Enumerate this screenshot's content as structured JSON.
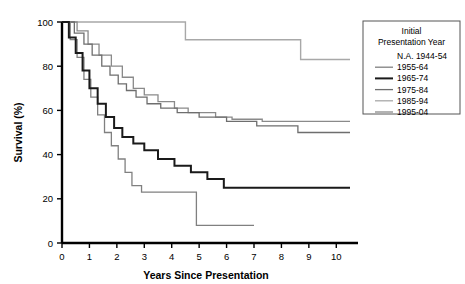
{
  "chart_data": {
    "type": "line",
    "title": "",
    "xlabel": "Years Since Presentation",
    "ylabel": "Survival (%)",
    "xlim": [
      0,
      10.5
    ],
    "ylim": [
      0,
      100
    ],
    "xticks": [
      "0",
      "1",
      "2",
      "3",
      "4",
      "5",
      "6",
      "7",
      "8",
      "9",
      "10"
    ],
    "yticks": [
      "0",
      "20",
      "40",
      "60",
      "80",
      "100"
    ],
    "grid": false,
    "step_style": "post",
    "legend": {
      "position": "outside-top-right",
      "title_line1": "Initial",
      "title_line2": "Presentation Year",
      "entries": [
        {
          "label": "N.A. 1944-54",
          "color": "#ffffff",
          "has_line": false,
          "width": 0
        },
        {
          "label": "1955-64",
          "color": "#808080",
          "has_line": true,
          "width": 1.3
        },
        {
          "label": "1965-74",
          "color": "#1a1a1a",
          "has_line": true,
          "width": 2.0
        },
        {
          "label": "1975-84",
          "color": "#6e6e6e",
          "has_line": true,
          "width": 1.3
        },
        {
          "label": "1985-94",
          "color": "#a8a8a8",
          "has_line": true,
          "width": 1.3
        },
        {
          "label": "1995-04",
          "color": "#8a8a8a",
          "has_line": true,
          "width": 1.3
        }
      ]
    },
    "series": [
      {
        "name": "1985-94",
        "color": "#a8a8a8",
        "width": 1.4,
        "x": [
          0,
          4.5,
          4.5,
          8.7,
          8.7,
          10.5
        ],
        "y": [
          100,
          100,
          92,
          92,
          83,
          83
        ]
      },
      {
        "name": "1995-04",
        "color": "#8a8a8a",
        "width": 1.3,
        "x": [
          0,
          0.55,
          0.55,
          0.95,
          0.95,
          1.35,
          1.35,
          1.8,
          1.8,
          2.2,
          2.2,
          2.6,
          2.6,
          3.0,
          3.0,
          3.5,
          3.5,
          4.1,
          4.1,
          4.6,
          4.6,
          5.6,
          5.6,
          6.2,
          6.2,
          7.3,
          7.3,
          10.5
        ],
        "y": [
          100,
          100,
          96,
          96,
          90,
          90,
          85,
          85,
          80,
          80,
          75,
          75,
          70,
          70,
          67,
          67,
          64,
          64,
          61,
          61,
          59,
          59,
          57,
          57,
          56,
          56,
          55,
          55
        ]
      },
      {
        "name": "1975-84",
        "color": "#6e6e6e",
        "width": 1.3,
        "x": [
          0,
          0.45,
          0.45,
          0.8,
          0.8,
          1.1,
          1.1,
          1.45,
          1.45,
          1.75,
          1.75,
          2.05,
          2.05,
          2.35,
          2.35,
          2.7,
          2.7,
          3.1,
          3.1,
          3.6,
          3.6,
          4.2,
          4.2,
          5.0,
          5.0,
          6.0,
          6.0,
          7.1,
          7.1,
          8.6,
          8.6,
          10.5
        ],
        "y": [
          100,
          100,
          95,
          95,
          90,
          90,
          85,
          85,
          80,
          80,
          76,
          76,
          72,
          72,
          69,
          69,
          66,
          66,
          63,
          63,
          61,
          61,
          59,
          59,
          57,
          57,
          55,
          55,
          53,
          53,
          50,
          50
        ]
      },
      {
        "name": "1955-64",
        "color": "#808080",
        "width": 1.3,
        "x": [
          0,
          0.3,
          0.3,
          0.55,
          0.55,
          0.8,
          0.8,
          1.05,
          1.05,
          1.3,
          1.3,
          1.55,
          1.55,
          1.8,
          1.8,
          2.05,
          2.05,
          2.3,
          2.3,
          2.55,
          2.55,
          2.9,
          2.9,
          4.9,
          4.9,
          7.0
        ],
        "y": [
          100,
          100,
          92,
          92,
          84,
          84,
          74,
          74,
          66,
          66,
          58,
          58,
          50,
          50,
          44,
          44,
          38,
          38,
          32,
          32,
          26,
          26,
          23,
          23,
          8,
          8
        ]
      },
      {
        "name": "1965-74",
        "color": "#1a1a1a",
        "width": 2.0,
        "x": [
          0,
          0.25,
          0.25,
          0.5,
          0.5,
          0.75,
          0.75,
          1.0,
          1.0,
          1.3,
          1.3,
          1.6,
          1.6,
          1.9,
          1.9,
          2.2,
          2.2,
          2.6,
          2.6,
          3.0,
          3.0,
          3.5,
          3.5,
          4.1,
          4.1,
          4.7,
          4.7,
          5.3,
          5.3,
          5.9,
          5.9,
          10.5
        ],
        "y": [
          100,
          100,
          93,
          93,
          86,
          86,
          78,
          78,
          70,
          70,
          63,
          63,
          57,
          57,
          52,
          52,
          48,
          48,
          45,
          45,
          42,
          42,
          38,
          38,
          35,
          35,
          32,
          32,
          29,
          29,
          25,
          25
        ]
      }
    ]
  }
}
